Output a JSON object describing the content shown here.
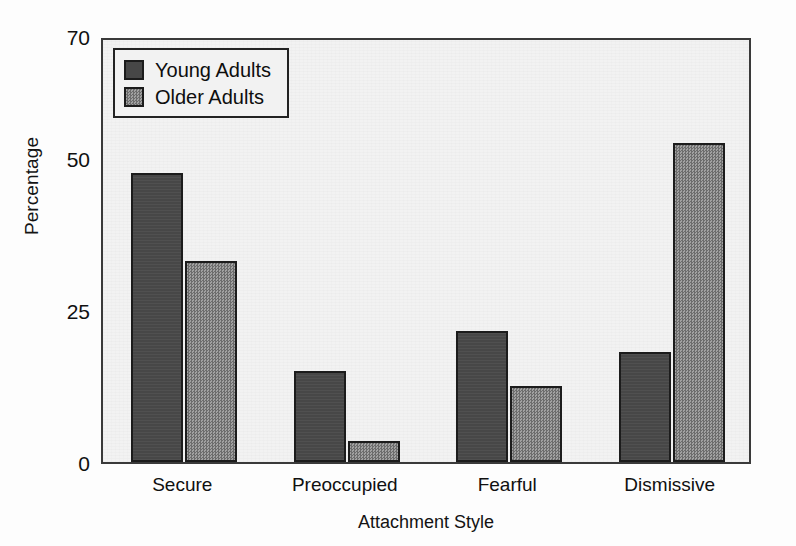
{
  "chart_data": {
    "type": "bar",
    "title": "",
    "xlabel": "Attachment Style",
    "ylabel": "Percentage",
    "categories": [
      "Secure",
      "Preoccupied",
      "Fearful",
      "Dismissive"
    ],
    "series": [
      {
        "name": "Young Adults",
        "color": "#474747",
        "values": [
          47.5,
          15,
          21.5,
          18
        ]
      },
      {
        "name": "Older Adults",
        "color": "#8a8a8a",
        "values": [
          33,
          3.5,
          12.5,
          52.5
        ]
      }
    ],
    "ylim": [
      0,
      70
    ],
    "yticks": [
      0,
      25,
      50,
      70
    ],
    "ytick_labels": [
      "0",
      "25",
      "50",
      "70"
    ],
    "grid": false,
    "legend_position": "top-left",
    "plot_background": "#f2f2f2",
    "axis_color": "#3a3a3a"
  },
  "legend": {
    "entries": [
      {
        "label": "Young Adults"
      },
      {
        "label": "Older Adults"
      }
    ]
  },
  "axes": {
    "y_title": "Percentage",
    "x_title": "Attachment Style",
    "y_tick_0": "0",
    "y_tick_25": "25",
    "y_tick_50": "50",
    "y_tick_70": "70"
  },
  "x_labels": {
    "c0": "Secure",
    "c1": "Preoccupied",
    "c2": "Fearful",
    "c3": "Dismissive"
  }
}
